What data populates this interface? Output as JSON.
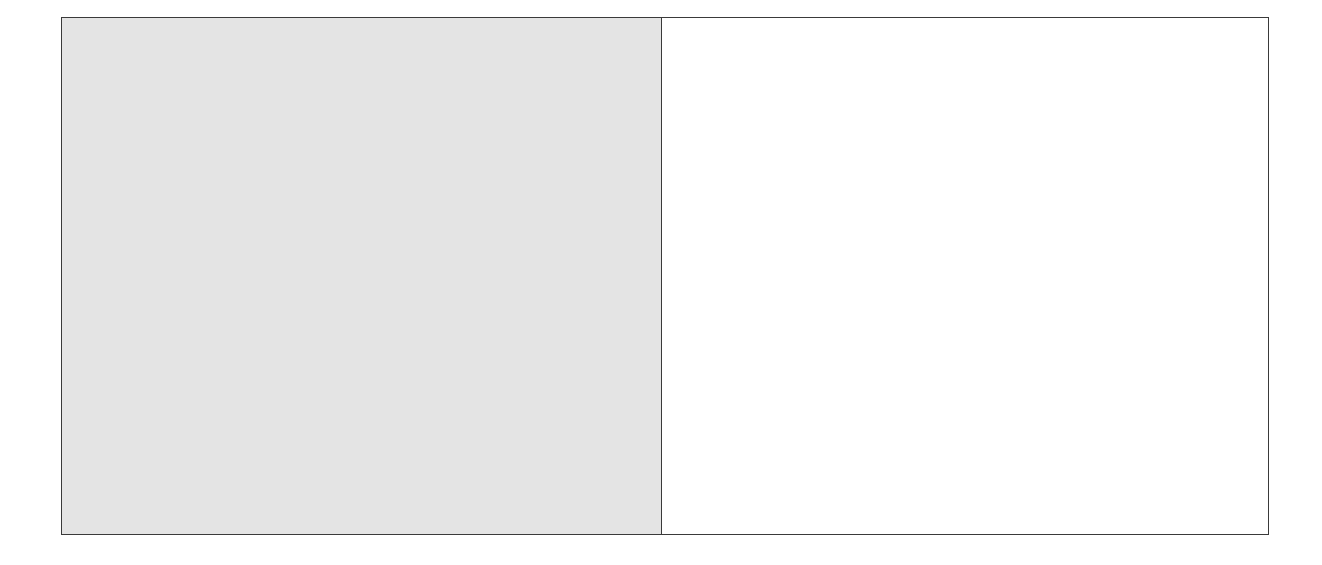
{
  "diagram": {
    "panels": [
      {
        "id": "left",
        "fill": "#e4e4e4"
      },
      {
        "id": "right",
        "fill": "#ffffff"
      }
    ],
    "border_color": "#3a3a3a"
  }
}
